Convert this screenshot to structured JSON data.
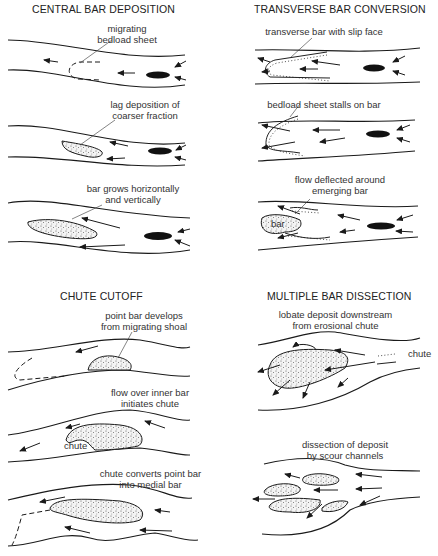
{
  "figure": {
    "panels": [
      {
        "id": "central-bar-deposition",
        "title": "CENTRAL BAR DEPOSITION",
        "stages": [
          {
            "label_line1": "migrating",
            "label_line2": "bedload sheet"
          },
          {
            "label_line1": "lag deposition of",
            "label_line2": "coarser fraction"
          },
          {
            "label_line1": "bar grows horizontally",
            "label_line2": "and vertically"
          }
        ]
      },
      {
        "id": "transverse-bar-conversion",
        "title": "TRANSVERSE BAR CONVERSION",
        "stages": [
          {
            "label_line1": "transverse bar with slip face",
            "label_line2": ""
          },
          {
            "label_line1": "bedload sheet stalls on bar",
            "label_line2": ""
          },
          {
            "label_line1": "flow deflected around",
            "label_line2": "emerging bar",
            "inline_label": "bar"
          }
        ]
      },
      {
        "id": "chute-cutoff",
        "title": "CHUTE CUTOFF",
        "stages": [
          {
            "label_line1": "point bar develops",
            "label_line2": "from migrating shoal"
          },
          {
            "label_line1": "flow over inner bar",
            "label_line2": "initiates chute",
            "inline_label": "chute"
          },
          {
            "label_line1": "chute converts point bar",
            "label_line2": "into medial bar"
          }
        ]
      },
      {
        "id": "multiple-bar-dissection",
        "title": "MULTIPLE BAR DISSECTION",
        "stages": [
          {
            "label_line1": "lobate deposit downstream",
            "label_line2": "from erosional chute",
            "inline_label": "chute"
          },
          {
            "label_line1": "dissection of deposit",
            "label_line2": "by scour channels"
          }
        ]
      }
    ],
    "colors": {
      "background": "#ffffff",
      "linework": "#1a1a1a",
      "text": "#333333"
    }
  }
}
